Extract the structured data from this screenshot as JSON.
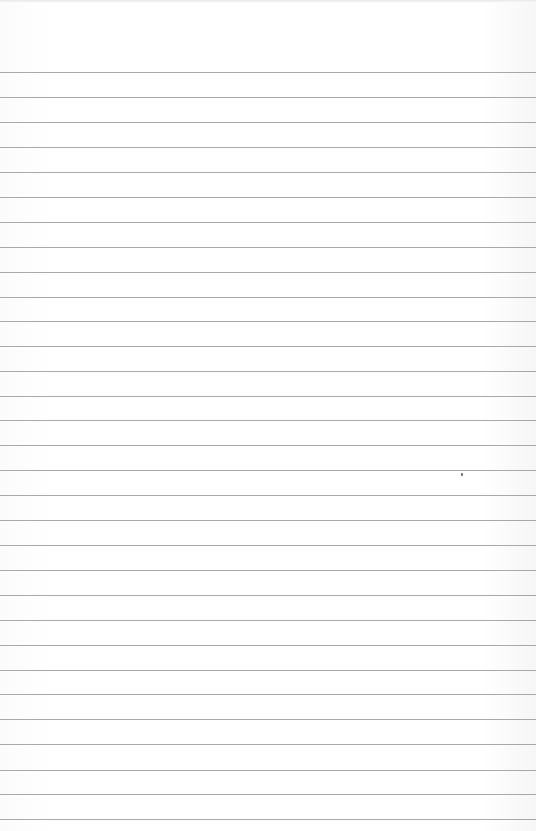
{
  "paper": {
    "type": "lined-paper",
    "background": "#ffffff",
    "rule_color": "#9a9a9a",
    "rules_y": [
      72,
      97,
      122,
      147,
      172,
      197,
      222,
      247,
      272,
      297,
      321,
      346,
      371,
      396,
      420,
      445,
      470,
      495,
      520,
      545,
      570,
      595,
      620,
      645,
      670,
      694,
      719,
      744,
      770,
      794,
      819
    ],
    "specks": [
      {
        "x": 461,
        "y": 473
      }
    ]
  }
}
